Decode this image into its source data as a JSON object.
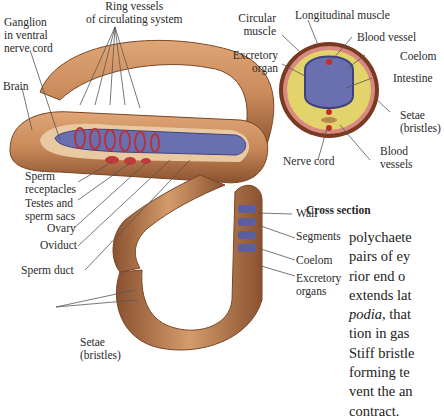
{
  "colors": {
    "skin": "#c98a5a",
    "skin_dark": "#8a5230",
    "intestine": "#6a6fb0",
    "vessel": "#b8323a",
    "coelom": "#e2d36a",
    "leader": "#555555"
  },
  "worm_labels": {
    "ganglion": [
      "Ganglion",
      "in ventral",
      "nerve cord"
    ],
    "ring_vessels": [
      "Ring vessels",
      "of circulating system"
    ],
    "brain": "Brain",
    "sperm_receptacles": [
      "Sperm",
      "receptacles"
    ],
    "testes": [
      "Testes and",
      "sperm sacs"
    ],
    "ovary": "Ovary",
    "oviduct": "Oviduct",
    "sperm_duct": "Sperm duct",
    "setae": [
      "Setae",
      "(bristles)"
    ],
    "wall": "Wall",
    "segments": "Segments",
    "coelom": "Coelom",
    "excretory_organs": [
      "Excretory",
      "organs"
    ]
  },
  "cross_section": {
    "caption": "Cross section",
    "labels": {
      "circular_muscle": [
        "Circular",
        "muscle"
      ],
      "longitudinal_muscle": "Longitudinal muscle",
      "blood_vessel": "Blood vessel",
      "excretory_organ": [
        "Excretory",
        "organ"
      ],
      "coelom": "Coelom",
      "intestine": "Intestine",
      "setae": [
        "Setae",
        "(bristles)"
      ],
      "nerve_cord": "Nerve cord",
      "blood_vessels": [
        "Blood",
        "vessels"
      ]
    }
  },
  "body_text": {
    "lines": [
      "polychaete",
      "pairs of ey",
      "rior end o",
      "extends lat",
      "that",
      "tion in gas",
      "Stiff bristle",
      "forming te",
      "vent the an",
      "contract."
    ],
    "italic_word": "podia,"
  }
}
